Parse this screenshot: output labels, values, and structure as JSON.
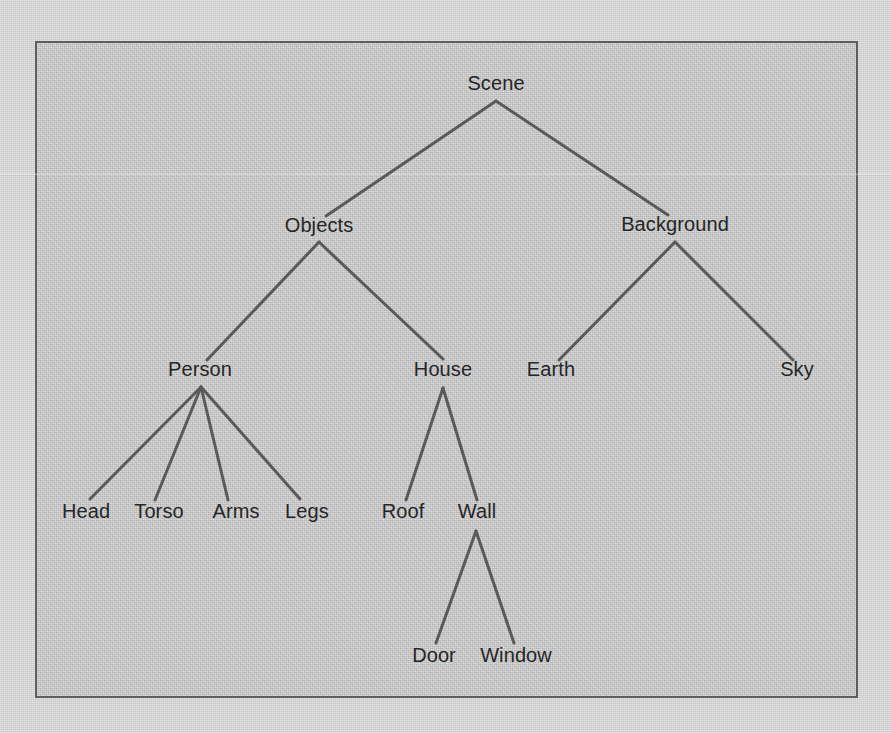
{
  "figure": {
    "frame": {
      "x": 35,
      "y": 41,
      "width": 823,
      "height": 657,
      "border_color": "#5e5e5e"
    },
    "colors": {
      "page_background": "#d5d5d5",
      "plate_background": "#c9c9c9",
      "edge_line": "#5a5a5a",
      "label_text": "#262626",
      "frame_border": "#5e5e5e"
    },
    "artifacts": {
      "scan_streak_y": 173,
      "scan_streak_note": "faint horizontal scanner streak crossing full width"
    }
  },
  "chart_data": {
    "type": "diagram",
    "diagram_type": "tree",
    "orientation": "top-down",
    "depth": 5,
    "node_count": 15,
    "edge_count": 14,
    "root": "Scene",
    "nodes": [
      {
        "id": "scene",
        "label": "Scene",
        "x": 496,
        "y": 93,
        "level": 0,
        "parent": null,
        "children": [
          "objects",
          "background"
        ]
      },
      {
        "id": "objects",
        "label": "Objects",
        "x": 319,
        "y": 235,
        "level": 1,
        "parent": "scene",
        "children": [
          "person",
          "house"
        ]
      },
      {
        "id": "background",
        "label": "Background",
        "x": 675,
        "y": 234,
        "level": 1,
        "parent": "scene",
        "children": [
          "earth",
          "sky"
        ]
      },
      {
        "id": "person",
        "label": "Person",
        "x": 200,
        "y": 379,
        "level": 2,
        "parent": "objects",
        "children": [
          "head",
          "torso",
          "arms",
          "legs"
        ]
      },
      {
        "id": "house",
        "label": "House",
        "x": 443,
        "y": 379,
        "level": 2,
        "parent": "objects",
        "children": [
          "roof",
          "wall"
        ]
      },
      {
        "id": "earth",
        "label": "Earth",
        "x": 551,
        "y": 379,
        "level": 2,
        "parent": "background",
        "children": []
      },
      {
        "id": "sky",
        "label": "Sky",
        "x": 797,
        "y": 379,
        "level": 2,
        "parent": "background",
        "children": []
      },
      {
        "id": "head",
        "label": "Head",
        "x": 86,
        "y": 521,
        "level": 3,
        "parent": "person",
        "children": []
      },
      {
        "id": "torso",
        "label": "Torso",
        "x": 159,
        "y": 521,
        "level": 3,
        "parent": "person",
        "children": []
      },
      {
        "id": "arms",
        "label": "Arms",
        "x": 236,
        "y": 521,
        "level": 3,
        "parent": "person",
        "children": []
      },
      {
        "id": "legs",
        "label": "Legs",
        "x": 307,
        "y": 521,
        "level": 3,
        "parent": "person",
        "children": []
      },
      {
        "id": "roof",
        "label": "Roof",
        "x": 403,
        "y": 521,
        "level": 3,
        "parent": "house",
        "children": []
      },
      {
        "id": "wall",
        "label": "Wall",
        "x": 477,
        "y": 521,
        "level": 3,
        "parent": "house",
        "children": [
          "door",
          "window"
        ]
      },
      {
        "id": "door",
        "label": "Door",
        "x": 434,
        "y": 665,
        "level": 4,
        "parent": "wall",
        "children": []
      },
      {
        "id": "window",
        "label": "Window",
        "x": 516,
        "y": 665,
        "level": 4,
        "parent": "wall",
        "children": []
      }
    ],
    "edges": [
      {
        "from": "scene",
        "to": "objects",
        "x1": 496,
        "y1": 101,
        "x2": 326,
        "y2": 216
      },
      {
        "from": "scene",
        "to": "background",
        "x1": 496,
        "y1": 101,
        "x2": 668,
        "y2": 215
      },
      {
        "from": "objects",
        "to": "person",
        "x1": 319,
        "y1": 242,
        "x2": 207,
        "y2": 360
      },
      {
        "from": "objects",
        "to": "house",
        "x1": 319,
        "y1": 242,
        "x2": 443,
        "y2": 359
      },
      {
        "from": "background",
        "to": "earth",
        "x1": 675,
        "y1": 242,
        "x2": 559,
        "y2": 360
      },
      {
        "from": "background",
        "to": "sky",
        "x1": 675,
        "y1": 242,
        "x2": 793,
        "y2": 360
      },
      {
        "from": "person",
        "to": "head",
        "x1": 201,
        "y1": 387,
        "x2": 90,
        "y2": 499
      },
      {
        "from": "person",
        "to": "torso",
        "x1": 201,
        "y1": 387,
        "x2": 155,
        "y2": 500
      },
      {
        "from": "person",
        "to": "arms",
        "x1": 201,
        "y1": 387,
        "x2": 228,
        "y2": 500
      },
      {
        "from": "person",
        "to": "legs",
        "x1": 201,
        "y1": 387,
        "x2": 300,
        "y2": 499
      },
      {
        "from": "house",
        "to": "roof",
        "x1": 443,
        "y1": 388,
        "x2": 406,
        "y2": 500
      },
      {
        "from": "house",
        "to": "wall",
        "x1": 443,
        "y1": 388,
        "x2": 477,
        "y2": 500
      },
      {
        "from": "wall",
        "to": "door",
        "x1": 476,
        "y1": 531,
        "x2": 436,
        "y2": 643
      },
      {
        "from": "wall",
        "to": "window",
        "x1": 476,
        "y1": 531,
        "x2": 514,
        "y2": 643
      }
    ],
    "levels": [
      {
        "level": 0,
        "labels": [
          "Scene"
        ]
      },
      {
        "level": 1,
        "labels": [
          "Objects",
          "Background"
        ]
      },
      {
        "level": 2,
        "labels": [
          "Person",
          "House",
          "Earth",
          "Sky"
        ]
      },
      {
        "level": 3,
        "labels": [
          "Head",
          "Torso",
          "Arms",
          "Legs",
          "Roof",
          "Wall"
        ]
      },
      {
        "level": 4,
        "labels": [
          "Door",
          "Window"
        ]
      }
    ],
    "style": {
      "edge_color": "#5a5a5a",
      "edge_width": 3,
      "label_font_size": 20,
      "grid": false,
      "legend": false,
      "axes": false
    }
  }
}
